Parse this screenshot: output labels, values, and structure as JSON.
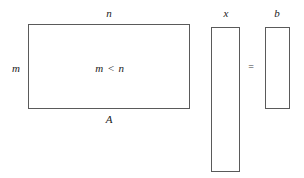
{
  "figure": {
    "background_color": "#ffffff",
    "stroke_color": "#5a5a5a",
    "text_color": "#1a1a1a",
    "width": 304,
    "height": 178
  },
  "matrix": {
    "name": "A",
    "label_bottom": "A",
    "label_top": "n",
    "label_left": "m",
    "label_inside": "m < n",
    "rows_symbol": "m",
    "cols_symbol": "n",
    "shape": "rectangle"
  },
  "vector_x": {
    "name": "x",
    "label_top": "x",
    "length_symbol": "n",
    "shape": "column"
  },
  "vector_b": {
    "name": "b",
    "label_top": "b",
    "length_symbol": "m",
    "shape": "column"
  },
  "operator": {
    "equals": "="
  },
  "chart_data": {
    "type": "diagram",
    "relation": "m < n",
    "blocks": [
      {
        "id": "A",
        "label": "A",
        "role": "matrix",
        "top_label": "n",
        "left_label": "m",
        "inner_label": "m < n",
        "x": 28,
        "y": 24,
        "width": 162,
        "height": 85
      },
      {
        "id": "x",
        "label": "x",
        "role": "unknown-vector",
        "top_label": "x",
        "x": 211,
        "y": 27,
        "width": 29,
        "height": 145
      },
      {
        "id": "b",
        "label": "b",
        "role": "rhs-vector",
        "top_label": "b",
        "x": 265,
        "y": 27,
        "width": 25,
        "height": 82
      }
    ],
    "operators": [
      {
        "symbol": "=",
        "x": 251,
        "y": 67
      }
    ]
  }
}
